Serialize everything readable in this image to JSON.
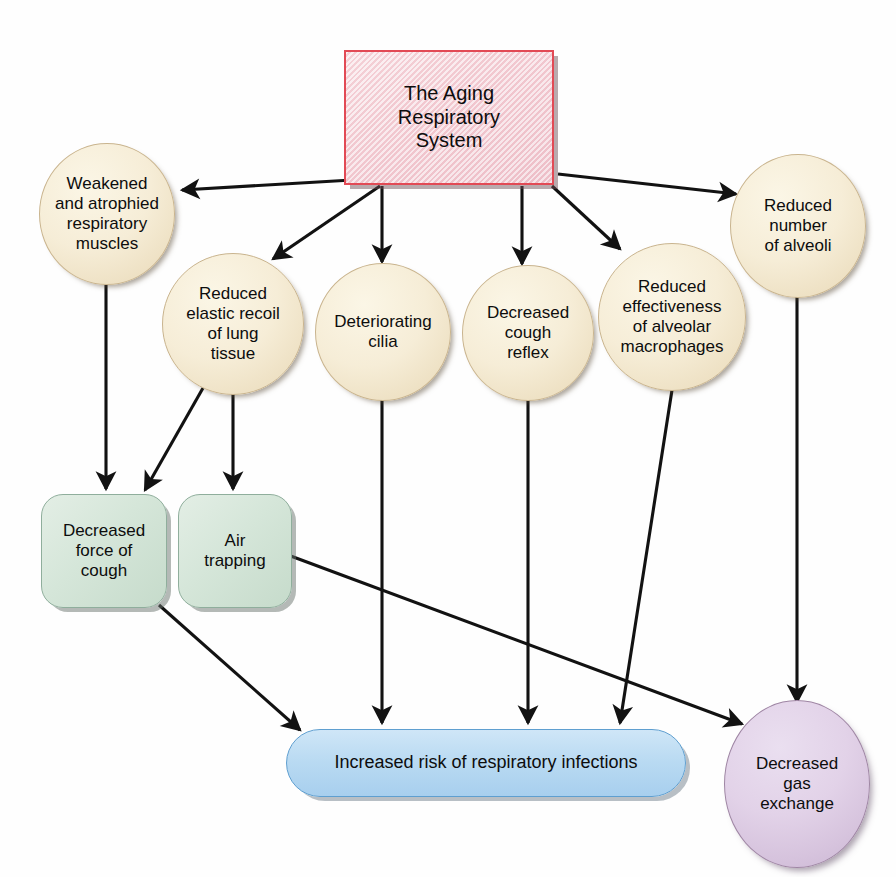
{
  "diagram": {
    "title": "The Aging Respiratory System",
    "type": "flowchart",
    "background_color": "#fefefe",
    "nodes": [
      {
        "id": "root",
        "label": "The Aging\nRespiratory\nSystem",
        "shape": "rectangle",
        "fill_color": "#f2cdd5",
        "border_color": "#e24a55"
      },
      {
        "id": "muscles",
        "label": "Weakened\nand atrophied\nrespiratory\nmuscles",
        "shape": "ellipse",
        "fill_color": "#f6edd7",
        "border_color": "#c9b48e"
      },
      {
        "id": "recoil",
        "label": "Reduced\nelastic recoil\nof lung\ntissue",
        "shape": "ellipse",
        "fill_color": "#f6edd7",
        "border_color": "#c9b48e"
      },
      {
        "id": "cilia",
        "label": "Deteriorating\ncilia",
        "shape": "ellipse",
        "fill_color": "#f6edd7",
        "border_color": "#c9b48e"
      },
      {
        "id": "reflex",
        "label": "Decreased\ncough\nreflex",
        "shape": "ellipse",
        "fill_color": "#f6edd7",
        "border_color": "#c9b48e"
      },
      {
        "id": "macrophages",
        "label": "Reduced\neffectiveness\nof alveolar\nmacrophages",
        "shape": "ellipse",
        "fill_color": "#f6edd7",
        "border_color": "#c9b48e"
      },
      {
        "id": "alveoli",
        "label": "Reduced\nnumber\nof alveoli",
        "shape": "ellipse",
        "fill_color": "#f6edd7",
        "border_color": "#c9b48e"
      },
      {
        "id": "force",
        "label": "Decreased\nforce of\ncough",
        "shape": "rounded-rectangle",
        "fill_color": "#d5e6d9",
        "border_color": "#8fae9c"
      },
      {
        "id": "airtrap",
        "label": "Air\ntrapping",
        "shape": "rounded-rectangle",
        "fill_color": "#d5e6d9",
        "border_color": "#8fae9c"
      },
      {
        "id": "infections",
        "label": "Increased risk of respiratory infections",
        "shape": "pill",
        "fill_color": "#b9daf2",
        "border_color": "#5f9fd0"
      },
      {
        "id": "gas",
        "label": "Decreased\ngas\nexchange",
        "shape": "ellipse",
        "fill_color": "#e2d2e8",
        "border_color": "#9f86a4"
      }
    ],
    "edges": [
      {
        "from": "root",
        "to": "muscles"
      },
      {
        "from": "root",
        "to": "recoil"
      },
      {
        "from": "root",
        "to": "cilia"
      },
      {
        "from": "root",
        "to": "reflex"
      },
      {
        "from": "root",
        "to": "macrophages"
      },
      {
        "from": "root",
        "to": "alveoli"
      },
      {
        "from": "muscles",
        "to": "force"
      },
      {
        "from": "recoil",
        "to": "force"
      },
      {
        "from": "recoil",
        "to": "airtrap"
      },
      {
        "from": "cilia",
        "to": "infections"
      },
      {
        "from": "reflex",
        "to": "infections"
      },
      {
        "from": "macrophages",
        "to": "infections"
      },
      {
        "from": "force",
        "to": "infections"
      },
      {
        "from": "airtrap",
        "to": "gas"
      },
      {
        "from": "alveoli",
        "to": "gas"
      }
    ],
    "edge_color": "#121212"
  }
}
